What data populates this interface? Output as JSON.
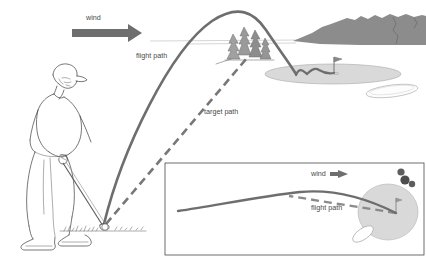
{
  "figure": {
    "background_color": "#ffffff"
  },
  "colors": {
    "wind_arrow": "#6e6e6e",
    "flight_path": "#6e6e6e",
    "target_path": "#777777",
    "mountain": "#8c8c8c",
    "tree": "#8f8f8f",
    "green": "#d6d6d6",
    "ink": "#3c3c3c",
    "label_text": "#4a4a4a"
  },
  "main_scene": {
    "wind_label": "wind",
    "wind_direction": "right",
    "flight_path_label": "flight path",
    "target_path_label": "target path",
    "golfer": {
      "name": "golfer-at-address",
      "facing": "right"
    },
    "features": [
      "tree-cluster",
      "mountain-ridge",
      "putting-green",
      "flagstick",
      "bunker",
      "golf-ball",
      "golf-club"
    ]
  },
  "inset": {
    "wind_label": "wind",
    "wind_direction": "left",
    "flight_path_label": "flight path",
    "view": "overhead",
    "features": [
      "tree-cluster",
      "putting-green",
      "flagstick",
      "bunker",
      "target-path-dashed",
      "flight-path-curve"
    ]
  }
}
